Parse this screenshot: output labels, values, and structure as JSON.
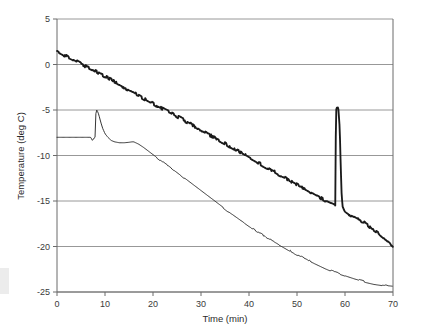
{
  "chart_data": {
    "type": "line",
    "title": "",
    "xlabel": "Time (min)",
    "ylabel": "Temperature (deg C)",
    "xlim": [
      0,
      70
    ],
    "ylim": [
      -25,
      5
    ],
    "xticks": [
      0,
      10,
      20,
      30,
      40,
      50,
      60,
      70
    ],
    "yticks": [
      5,
      0,
      -5,
      -10,
      -15,
      -20,
      -25
    ],
    "xtick_labels": [
      "0",
      "10",
      "20",
      "30",
      "40",
      "50",
      "60",
      "70"
    ],
    "ytick_labels": [
      "5",
      "0",
      "-5",
      "-10",
      "-15",
      "-20",
      "-25"
    ],
    "grid": "horizontal",
    "legend": "none",
    "series": [
      {
        "name": "upper-trace",
        "style": "noisy-thick",
        "color": "#1a1a1a",
        "points": [
          [
            0.0,
            1.5
          ],
          [
            1.0,
            1.2
          ],
          [
            2.0,
            0.9
          ],
          [
            3.0,
            0.65
          ],
          [
            4.0,
            0.35
          ],
          [
            5.0,
            0.05
          ],
          [
            6.0,
            -0.2
          ],
          [
            7.0,
            -0.45
          ],
          [
            8.0,
            -0.7
          ],
          [
            9.0,
            -1.0
          ],
          [
            10.0,
            -1.3
          ],
          [
            11.0,
            -1.6
          ],
          [
            12.0,
            -1.9
          ],
          [
            13.0,
            -2.2
          ],
          [
            14.0,
            -2.5
          ],
          [
            15.0,
            -2.8
          ],
          [
            16.0,
            -3.1
          ],
          [
            17.0,
            -3.4
          ],
          [
            18.0,
            -3.7
          ],
          [
            19.0,
            -4.0
          ],
          [
            20.0,
            -4.3
          ],
          [
            21.0,
            -4.6
          ],
          [
            22.0,
            -4.85
          ],
          [
            23.0,
            -5.1
          ],
          [
            24.0,
            -5.4
          ],
          [
            25.0,
            -5.7
          ],
          [
            26.0,
            -6.0
          ],
          [
            27.0,
            -6.3
          ],
          [
            28.0,
            -6.6
          ],
          [
            29.0,
            -6.9
          ],
          [
            30.0,
            -7.2
          ],
          [
            31.0,
            -7.5
          ],
          [
            32.0,
            -7.8
          ],
          [
            33.0,
            -8.1
          ],
          [
            34.0,
            -8.4
          ],
          [
            35.0,
            -8.7
          ],
          [
            36.0,
            -9.0
          ],
          [
            37.0,
            -9.3
          ],
          [
            38.0,
            -9.6
          ],
          [
            39.0,
            -9.9
          ],
          [
            40.0,
            -10.2
          ],
          [
            41.0,
            -10.5
          ],
          [
            42.0,
            -10.8
          ],
          [
            43.0,
            -11.1
          ],
          [
            44.0,
            -11.4
          ],
          [
            45.0,
            -11.7
          ],
          [
            46.0,
            -12.0
          ],
          [
            47.0,
            -12.3
          ],
          [
            48.0,
            -12.6
          ],
          [
            49.0,
            -12.9
          ],
          [
            50.0,
            -13.2
          ],
          [
            51.0,
            -13.5
          ],
          [
            52.0,
            -13.8
          ],
          [
            53.0,
            -14.1
          ],
          [
            54.0,
            -14.4
          ],
          [
            55.0,
            -14.7
          ],
          [
            56.0,
            -15.0
          ],
          [
            57.0,
            -15.25
          ],
          [
            57.8,
            -15.45
          ],
          [
            58.0,
            -15.5
          ],
          [
            58.05,
            -10.0
          ],
          [
            58.1,
            -6.5
          ],
          [
            58.2,
            -4.75
          ],
          [
            58.6,
            -4.72
          ],
          [
            58.9,
            -7.0
          ],
          [
            59.1,
            -11.0
          ],
          [
            59.3,
            -14.3
          ],
          [
            59.5,
            -15.6
          ],
          [
            59.8,
            -16.0
          ],
          [
            60.2,
            -16.2
          ],
          [
            61.0,
            -16.5
          ],
          [
            62.0,
            -16.8
          ],
          [
            63.0,
            -17.1
          ],
          [
            64.0,
            -17.4
          ],
          [
            65.0,
            -17.75
          ],
          [
            66.0,
            -18.1
          ],
          [
            67.0,
            -18.5
          ],
          [
            68.0,
            -18.95
          ],
          [
            69.0,
            -19.5
          ],
          [
            70.0,
            -20.0
          ]
        ]
      },
      {
        "name": "lower-trace",
        "style": "thin-smooth",
        "color": "#2a2a2a",
        "points": [
          [
            0.0,
            -8.0
          ],
          [
            2.0,
            -8.0
          ],
          [
            4.0,
            -8.0
          ],
          [
            6.0,
            -8.0
          ],
          [
            7.0,
            -8.0
          ],
          [
            7.4,
            -8.35
          ],
          [
            7.7,
            -8.1
          ],
          [
            7.9,
            -8.0
          ],
          [
            8.0,
            -8.0
          ],
          [
            8.05,
            -6.4
          ],
          [
            8.1,
            -5.4
          ],
          [
            8.2,
            -5.0
          ],
          [
            8.35,
            -5.02
          ],
          [
            8.7,
            -5.5
          ],
          [
            9.1,
            -6.3
          ],
          [
            9.5,
            -7.0
          ],
          [
            10.0,
            -7.6
          ],
          [
            10.6,
            -8.0
          ],
          [
            11.3,
            -8.35
          ],
          [
            12.0,
            -8.5
          ],
          [
            13.0,
            -8.6
          ],
          [
            14.0,
            -8.6
          ],
          [
            15.0,
            -8.55
          ],
          [
            15.6,
            -8.5
          ],
          [
            16.0,
            -8.5
          ],
          [
            17.0,
            -8.75
          ],
          [
            18.0,
            -9.1
          ],
          [
            19.0,
            -9.5
          ],
          [
            20.0,
            -9.9
          ],
          [
            22.0,
            -10.7
          ],
          [
            24.0,
            -11.5
          ],
          [
            26.0,
            -12.3
          ],
          [
            28.0,
            -13.1
          ],
          [
            30.0,
            -13.9
          ],
          [
            32.0,
            -14.7
          ],
          [
            34.0,
            -15.5
          ],
          [
            36.0,
            -16.3
          ],
          [
            38.0,
            -17.05
          ],
          [
            40.0,
            -17.8
          ],
          [
            42.0,
            -18.45
          ],
          [
            44.0,
            -19.1
          ],
          [
            46.0,
            -19.7
          ],
          [
            48.0,
            -20.3
          ],
          [
            50.0,
            -20.9
          ],
          [
            52.0,
            -21.4
          ],
          [
            54.0,
            -21.9
          ],
          [
            56.0,
            -22.4
          ],
          [
            58.0,
            -22.85
          ],
          [
            60.0,
            -23.2
          ],
          [
            62.0,
            -23.55
          ],
          [
            64.0,
            -23.85
          ],
          [
            66.0,
            -24.1
          ],
          [
            68.0,
            -24.25
          ],
          [
            70.0,
            -24.35
          ]
        ]
      }
    ]
  },
  "style": {
    "axis_color": "#6b6b6b",
    "grid_color": "#8c8c8c",
    "upper_trace_color": "#1a1a1a",
    "lower_trace_color": "#2a2a2a",
    "background": "#ffffff",
    "tick_text_color": "#3a3a3a"
  },
  "plot_box": {
    "left": 57,
    "top": 19,
    "right": 393,
    "bottom": 292
  }
}
